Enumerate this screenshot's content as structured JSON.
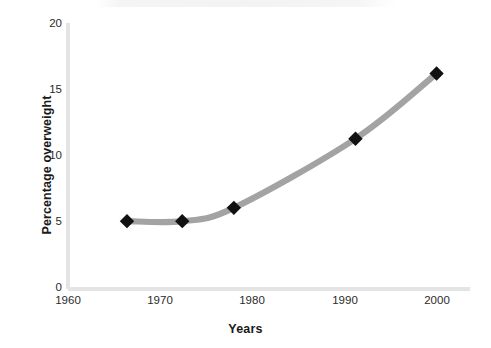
{
  "chart_data": {
    "type": "line",
    "title": "",
    "xlabel": "Years",
    "ylabel": "Percentage overweight",
    "x": [
      1966.4,
      1972.4,
      1978.0,
      1991.2,
      2000.0
    ],
    "values": [
      5.1,
      5.1,
      6.1,
      11.3,
      16.2
    ],
    "series": [
      {
        "name": "Percentage overweight",
        "x": [
          1966.4,
          1972.4,
          1978.0,
          1991.2,
          2000.0
        ],
        "values": [
          5.1,
          5.1,
          6.1,
          11.3,
          16.2
        ]
      }
    ],
    "xlim": [
      1960,
      2002
    ],
    "ylim": [
      0,
      20
    ],
    "xticks": [
      "1960",
      "1970",
      "1980",
      "1990",
      "2000"
    ],
    "xtick_values": [
      1960,
      1970,
      1980,
      1990,
      2000
    ],
    "yticks": [
      "0",
      "5",
      "10",
      "15",
      "20"
    ],
    "ytick_values": [
      0,
      5,
      10,
      15,
      20
    ],
    "grid": false,
    "legend": "none",
    "line_color": "#a3a3a3",
    "marker_color": "#111111",
    "marker_shape": "diamond",
    "axis_color": "#e2e2e2",
    "smoothed": true
  },
  "axes": {
    "y_title": "Percentage overweight",
    "x_title": "Years",
    "y_ticks": [
      {
        "label": "20",
        "value": 20
      },
      {
        "label": "15",
        "value": 15
      },
      {
        "label": "10",
        "value": 10
      },
      {
        "label": "5",
        "value": 5
      },
      {
        "label": "0",
        "value": 0
      }
    ],
    "x_ticks": [
      {
        "label": "1960",
        "value": 1960
      },
      {
        "label": "1970",
        "value": 1970
      },
      {
        "label": "1980",
        "value": 1980
      },
      {
        "label": "1990",
        "value": 1990
      },
      {
        "label": "2000",
        "value": 2000
      }
    ]
  },
  "points": [
    {
      "label": "1966, 5.1",
      "x": 1966.4,
      "y": 5.1
    },
    {
      "label": "1972, 5.1",
      "x": 1972.4,
      "y": 5.1
    },
    {
      "label": "1978, 6.1",
      "x": 1978.0,
      "y": 6.1
    },
    {
      "label": "1991, 11.3",
      "x": 1991.2,
      "y": 11.3
    },
    {
      "label": "2000, 16.2",
      "x": 2000.0,
      "y": 16.2
    }
  ]
}
